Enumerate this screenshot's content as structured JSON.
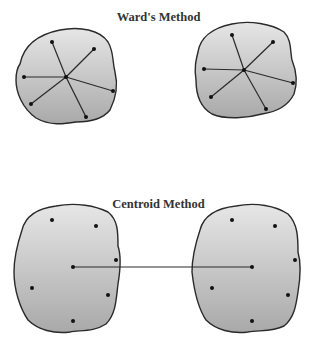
{
  "panels": [
    {
      "title": "Ward's Method",
      "title_y": 10,
      "connection": "spokes",
      "clusters": [
        {
          "blob": "M20,64 C24,44 40,34 60,30 C80,26 100,30 108,42 C114,52 112,60 115,72 C118,84 116,98 110,110 C102,120 88,122 76,122 C64,124 50,126 36,118 C22,108 16,92 16,80 C16,72 17,68 20,64 Z",
          "center": [
            66,
            77
          ],
          "points": [
            [
              52,
              42
            ],
            [
              94,
              49
            ],
            [
              24,
              77
            ],
            [
              113,
              91
            ],
            [
              31,
              104
            ],
            [
              86,
              117
            ]
          ]
        },
        {
          "blob": "M198,52 C200,38 212,28 232,24 C250,20 272,24 284,32 C292,40 290,52 292,60 C296,70 298,82 294,94 C288,106 276,112 262,114 C248,118 226,120 212,114 C198,106 196,92 196,80 C194,68 196,60 198,52 Z",
          "center": [
            244,
            70
          ],
          "points": [
            [
              232,
              35
            ],
            [
              273,
              42
            ],
            [
              204,
              69
            ],
            [
              293,
              83
            ],
            [
              211,
              97
            ],
            [
              266,
              109
            ]
          ]
        }
      ]
    },
    {
      "title": "Centroid Method",
      "title_y": 197,
      "connection": "centroid-link",
      "clusters": [
        {
          "blob": "M22,230 C26,214 40,208 56,206 C76,202 96,206 108,212 C118,220 118,232 118,246 C122,258 120,272 118,284 C116,300 116,314 106,324 C94,332 80,330 70,332 C54,334 38,330 28,320 C20,308 14,290 14,272 C14,256 18,242 22,230 Z",
          "center": [
            73,
            267
          ],
          "points": [
            [
              52,
              220
            ],
            [
              96,
              226
            ],
            [
              116,
              260
            ],
            [
              32,
              288
            ],
            [
              108,
              295
            ],
            [
              73,
              321
            ]
          ]
        },
        {
          "blob": "M200,230 C204,214 218,208 236,206 C256,202 276,206 288,214 C298,224 298,238 298,252 C302,266 300,280 298,292 C296,306 294,318 284,326 C272,332 260,330 248,332 C232,334 216,330 206,320 C198,308 194,290 192,272 C192,256 196,242 200,230 Z",
          "center": [
            252,
            267
          ],
          "points": [
            [
              232,
              220
            ],
            [
              275,
              226
            ],
            [
              295,
              260
            ],
            [
              212,
              288
            ],
            [
              288,
              295
            ],
            [
              252,
              321
            ]
          ]
        }
      ]
    }
  ],
  "colors": {
    "fill_light": "#e4e4e4",
    "fill_dark": "#aeaeae",
    "stroke": "#2a2a2a",
    "point": "#111111"
  }
}
